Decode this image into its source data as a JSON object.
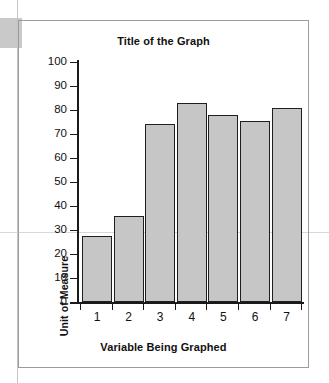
{
  "chart_data": {
    "type": "bar",
    "title": "Title of the Graph",
    "xlabel": "Variable Being Graphed",
    "ylabel": "Unit of Measure",
    "categories": [
      "1",
      "2",
      "3",
      "4",
      "5",
      "6",
      "7"
    ],
    "values": [
      27.5,
      36,
      74,
      83,
      78,
      75.5,
      81
    ],
    "ylim": [
      0,
      100
    ],
    "ytick_step": 10,
    "yticks": [
      "0",
      "10",
      "20",
      "30",
      "40",
      "50",
      "60",
      "70",
      "80",
      "90",
      "100"
    ],
    "grid": false,
    "legend": null,
    "bar_fill_color": "#c6c6c6",
    "bar_edge_color": "#1f1f1f",
    "axis_color": "#1a1a1a",
    "background_color": "#ffffff",
    "frame_color": "#9b9b9b"
  }
}
